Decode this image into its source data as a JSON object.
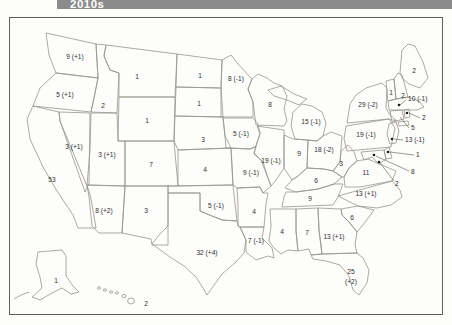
{
  "banner": {
    "title": "2010s",
    "bg": "#8b8b8b",
    "text_color": "#ffffff"
  },
  "map": {
    "frame_color": "#5f5f5f",
    "line_color": "#98948e",
    "label_color": "#2e2e2e"
  },
  "chart_data": {
    "type": "table",
    "title": "2010s",
    "states": [
      {
        "name": "washington",
        "label": "9 (+1)",
        "value": 9,
        "change": 1,
        "x": 75,
        "y": 57
      },
      {
        "name": "oregon",
        "label": "5 (+1)",
        "value": 5,
        "change": 1,
        "x": 65,
        "y": 95
      },
      {
        "name": "california",
        "label": "53",
        "value": 53,
        "change": 0,
        "x": 52,
        "y": 180
      },
      {
        "name": "nevada",
        "label": "3 (+1)",
        "value": 3,
        "change": 1,
        "x": 74,
        "y": 147
      },
      {
        "name": "idaho",
        "label": "2",
        "value": 2,
        "change": 0,
        "x": 103,
        "y": 106
      },
      {
        "name": "montana",
        "label": "1",
        "value": 1,
        "change": 0,
        "x": 137,
        "y": 77
      },
      {
        "name": "wyoming",
        "label": "1",
        "value": 1,
        "change": 0,
        "x": 147,
        "y": 121
      },
      {
        "name": "utah",
        "label": "3 (+1)",
        "value": 3,
        "change": 1,
        "x": 107,
        "y": 155
      },
      {
        "name": "colorado",
        "label": "7",
        "value": 7,
        "change": 0,
        "x": 151,
        "y": 165
      },
      {
        "name": "arizona",
        "label": "8 (+2)",
        "value": 8,
        "change": 2,
        "x": 104,
        "y": 211
      },
      {
        "name": "new-mexico",
        "label": "3",
        "value": 3,
        "change": 0,
        "x": 146,
        "y": 211
      },
      {
        "name": "north-dakota",
        "label": "1",
        "value": 1,
        "change": 0,
        "x": 200,
        "y": 76
      },
      {
        "name": "south-dakota",
        "label": "1",
        "value": 1,
        "change": 0,
        "x": 199,
        "y": 104
      },
      {
        "name": "nebraska",
        "label": "3",
        "value": 3,
        "change": 0,
        "x": 203,
        "y": 140
      },
      {
        "name": "kansas",
        "label": "4",
        "value": 4,
        "change": 0,
        "x": 205,
        "y": 170
      },
      {
        "name": "oklahoma",
        "label": "5 (-1)",
        "value": 5,
        "change": -1,
        "x": 216,
        "y": 206
      },
      {
        "name": "texas",
        "label": "32 (+4)",
        "value": 32,
        "change": 4,
        "x": 207,
        "y": 253
      },
      {
        "name": "minnesota",
        "label": "8 (-1)",
        "value": 8,
        "change": -1,
        "x": 236,
        "y": 79
      },
      {
        "name": "iowa",
        "label": "5 (-1)",
        "value": 5,
        "change": -1,
        "x": 241,
        "y": 134
      },
      {
        "name": "missouri",
        "label": "9 (-1)",
        "value": 9,
        "change": -1,
        "x": 251,
        "y": 173
      },
      {
        "name": "arkansas",
        "label": "4",
        "value": 4,
        "change": 0,
        "x": 254,
        "y": 212
      },
      {
        "name": "louisiana",
        "label": "7 (-1)",
        "value": 7,
        "change": -1,
        "x": 256,
        "y": 241
      },
      {
        "name": "wisconsin",
        "label": "8",
        "value": 8,
        "change": 0,
        "x": 270,
        "y": 105
      },
      {
        "name": "illinois",
        "label": "19 (-1)",
        "value": 19,
        "change": -1,
        "x": 271,
        "y": 161
      },
      {
        "name": "michigan",
        "label": "15 (-1)",
        "value": 15,
        "change": -1,
        "x": 311,
        "y": 122
      },
      {
        "name": "indiana",
        "label": "9",
        "value": 9,
        "change": 0,
        "x": 299,
        "y": 154
      },
      {
        "name": "ohio",
        "label": "18 (-2)",
        "value": 18,
        "change": -2,
        "x": 324,
        "y": 150
      },
      {
        "name": "kentucky",
        "label": "6",
        "value": 6,
        "change": 0,
        "x": 316,
        "y": 181
      },
      {
        "name": "tennessee",
        "label": "9",
        "value": 9,
        "change": 0,
        "x": 310,
        "y": 199
      },
      {
        "name": "mississippi",
        "label": "4",
        "value": 4,
        "change": 0,
        "x": 282,
        "y": 232
      },
      {
        "name": "alabama",
        "label": "7",
        "value": 7,
        "change": 0,
        "x": 307,
        "y": 233
      },
      {
        "name": "georgia",
        "label": "13 (+1)",
        "value": 13,
        "change": 1,
        "x": 334,
        "y": 237
      },
      {
        "name": "florida",
        "label": "25",
        "label2": "(+2)",
        "value": 25,
        "change": 2,
        "x": 351,
        "y": 272
      },
      {
        "name": "south-carolina",
        "label": "6",
        "value": 6,
        "change": 0,
        "x": 352,
        "y": 218
      },
      {
        "name": "north-carolina",
        "label": "13 (+1)",
        "value": 13,
        "change": 1,
        "x": 366,
        "y": 194
      },
      {
        "name": "virginia",
        "label": "11",
        "value": 11,
        "change": 0,
        "x": 366,
        "y": 173
      },
      {
        "name": "west-virginia",
        "label": "3",
        "value": 3,
        "change": 0,
        "x": 341,
        "y": 164
      },
      {
        "name": "pennsylvania",
        "label": "19 (-1)",
        "value": 19,
        "change": -1,
        "x": 366,
        "y": 135
      },
      {
        "name": "new-york",
        "label": "29 (-2)",
        "value": 29,
        "change": -2,
        "x": 368,
        "y": 105
      },
      {
        "name": "maine",
        "label": "2",
        "value": 2,
        "change": 0,
        "x": 414,
        "y": 71
      },
      {
        "name": "vermont",
        "label": "1",
        "value": 1,
        "change": 0,
        "x": 391,
        "y": 93
      },
      {
        "name": "new-hampshire",
        "label": "2",
        "value": 2,
        "change": 0,
        "x": 403,
        "y": 96
      },
      {
        "name": "alaska",
        "label": "1",
        "value": 1,
        "change": 0,
        "x": 56,
        "y": 281
      },
      {
        "name": "hawaii",
        "label": "2",
        "value": 2,
        "change": 0,
        "x": 146,
        "y": 304
      }
    ],
    "callouts": [
      {
        "name": "massachusetts",
        "label": "10 (-1)",
        "value": 10,
        "change": -1,
        "x": 408,
        "y": 101,
        "line": [
          406,
          100,
          400,
          105
        ],
        "dot": [
          399,
          105
        ]
      },
      {
        "name": "rhode-island",
        "label": "2",
        "value": 2,
        "change": 0,
        "x": 422,
        "y": 120,
        "line": [
          420,
          118,
          409,
          113
        ],
        "dot": [
          407,
          113
        ]
      },
      {
        "name": "connecticut",
        "label": "5",
        "value": 5,
        "change": 0,
        "x": 411,
        "y": 130,
        "line": [
          409,
          128,
          400,
          117
        ],
        "dot": null
      },
      {
        "name": "new-jersey",
        "label": "13 (-1)",
        "value": 13,
        "change": -1,
        "x": 405,
        "y": 142,
        "line": [
          403,
          140,
          394,
          139
        ],
        "dot": [
          392,
          139
        ]
      },
      {
        "name": "delaware",
        "label": "1",
        "value": 1,
        "change": 0,
        "x": 416,
        "y": 157,
        "line": [
          414,
          155,
          390,
          152
        ],
        "dot": [
          388,
          152
        ]
      },
      {
        "name": "maryland",
        "label": "8",
        "value": 8,
        "change": 0,
        "x": 411,
        "y": 174,
        "line": [
          409,
          171,
          376,
          156
        ],
        "dot": [
          374,
          155
        ]
      },
      {
        "name": "district-of-columbia",
        "label": "2",
        "value": 2,
        "change": 0,
        "x": 395,
        "y": 186,
        "line": [
          394,
          181,
          380,
          163
        ],
        "dot": [
          379,
          162
        ]
      }
    ]
  }
}
